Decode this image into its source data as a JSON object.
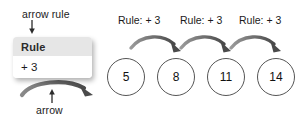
{
  "diagram": {
    "title_hidden": "",
    "colors": {
      "arrow_dark": "#4a4a4a",
      "arrow_mid": "#6f6f6f",
      "circle_stroke": "#555555",
      "box_header_bg": "#e6e6e6",
      "box_body_bg": "#ffffff",
      "text": "#1a1a1a",
      "background": "#ffffff"
    },
    "callouts": [
      {
        "name": "arrow-rule",
        "label": "arrow rule",
        "pointer": "down-arrow-icon"
      },
      {
        "name": "arrow",
        "label": "arrow",
        "pointer": "up-arrow-icon"
      }
    ],
    "rule_box": {
      "header": "Rule",
      "body": "+ 3"
    },
    "chain": {
      "rule_labels": [
        "Rule: + 3",
        "Rule: + 3",
        "Rule: + 3"
      ],
      "nodes": [
        {
          "value": "5"
        },
        {
          "value": "8"
        },
        {
          "value": "11"
        },
        {
          "value": "14"
        }
      ],
      "connector_icon": "curved-arrow-right-icon"
    }
  }
}
